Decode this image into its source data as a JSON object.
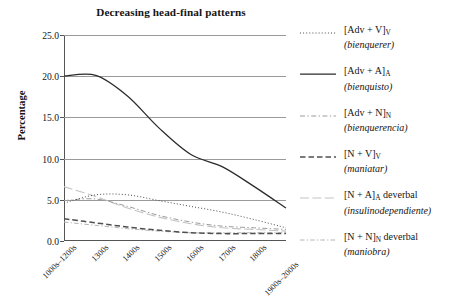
{
  "chart_data": {
    "type": "line",
    "title": "Decreasing head-final patterns",
    "xlabel": "",
    "ylabel": "Percentage",
    "ylim": [
      0.0,
      25.0
    ],
    "yticks": [
      "0.0",
      "5.0",
      "10.0",
      "15.0",
      "20.0",
      "25.0"
    ],
    "ytick_values": [
      0.0,
      5.0,
      10.0,
      15.0,
      20.0,
      25.0
    ],
    "grid": "horizontal",
    "legend_position": "right",
    "categories": [
      "1000s–1200s",
      "1300s",
      "1400s",
      "1500s",
      "1600s",
      "1700s",
      "1800s",
      "1900s–2000s"
    ],
    "series": [
      {
        "name": "[Adv + V]V (bienquerer)",
        "style": "dotted",
        "values": [
          4.6,
          5.6,
          5.6,
          4.9,
          4.2,
          3.5,
          2.6,
          1.6
        ]
      },
      {
        "name": "[Adv + A]A (bienquisto)",
        "style": "solid",
        "values": [
          20.0,
          20.1,
          17.6,
          13.7,
          10.5,
          9.0,
          6.6,
          4.0
        ]
      },
      {
        "name": "[Adv + N]N (bienquerencia)",
        "style": "dashdot",
        "values": [
          4.9,
          5.1,
          4.2,
          3.1,
          2.3,
          1.8,
          1.6,
          1.4
        ]
      },
      {
        "name": "[N + V]V (maniatar)",
        "style": "dashed",
        "values": [
          2.7,
          2.2,
          1.7,
          1.3,
          1.0,
          0.9,
          0.9,
          0.9
        ]
      },
      {
        "name": "[N + A]A deverbal (insulinodependiente)",
        "style": "longdash-light",
        "values": [
          6.6,
          5.4,
          4.0,
          2.9,
          2.1,
          1.6,
          1.4,
          1.2
        ]
      },
      {
        "name": "[N + N]N deverbal (maniobra)",
        "style": "dashdot-light",
        "values": [
          2.3,
          1.9,
          1.5,
          1.2,
          1.0,
          1.0,
          1.0,
          1.0
        ]
      }
    ]
  },
  "chart": {
    "title": "Decreasing head-final patterns",
    "ylabel": "Percentage",
    "yticks": [
      "25.0",
      "20.0",
      "15.0",
      "10.0",
      "5.0",
      "0.0"
    ],
    "xticks": [
      "1000s–1200s",
      "1300s",
      "1400s",
      "1500s",
      "1600s",
      "1700s",
      "1800s",
      "1900s–2000s"
    ]
  },
  "legend": {
    "items": [
      {
        "pattern": "[Adv + V]",
        "sub": "V",
        "suffix": "",
        "example": "(bienquerer)",
        "style": "dotted"
      },
      {
        "pattern": "[Adv + A]",
        "sub": "A",
        "suffix": "",
        "example": "(bienquisto)",
        "style": "solid"
      },
      {
        "pattern": "[Adv + N]",
        "sub": "N",
        "suffix": "",
        "example": "(bienquerencia)",
        "style": "dashdot"
      },
      {
        "pattern": "[N + V]",
        "sub": "V",
        "suffix": "",
        "example": "(maniatar)",
        "style": "dashed"
      },
      {
        "pattern": "[N + A]",
        "sub": "A",
        "suffix": " deverbal",
        "example": "(insulinodependiente)",
        "style": "longdash-light"
      },
      {
        "pattern": "[N + N]",
        "sub": "N",
        "suffix": " deverbal",
        "example": "(maniobra)",
        "style": "dashdot-light"
      }
    ]
  }
}
